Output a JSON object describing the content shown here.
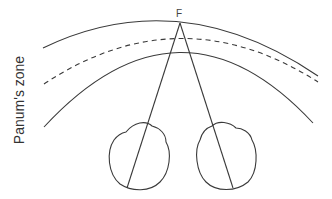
{
  "diagram": {
    "y_label": "Panum's zone",
    "fixation_label": "F",
    "elements": {
      "outer_horopter_limit": "solid arc",
      "horopter": "dashed arc",
      "inner_horopter_limit": "solid arc",
      "left_eye": "eye outline with visual axis",
      "right_eye": "eye outline with visual axis"
    },
    "colors": {
      "line": "#3a3a3a",
      "text": "#333333",
      "background": "#ffffff"
    }
  }
}
